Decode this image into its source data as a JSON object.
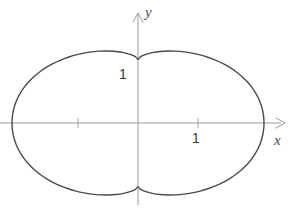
{
  "figure": {
    "kind": "math-plot",
    "background_color": "#ffffff",
    "curve_color": "#4a4a4a",
    "axis_color": "#9a9a9a",
    "label_color": "#3a3a3a"
  },
  "axes": {
    "x_label": "x",
    "y_label": "y",
    "x_arrow": "arrow-right",
    "y_arrow": "arrow-up",
    "origin_px": {
      "x": 138,
      "y": 123
    },
    "unit_px": 60,
    "x_range": [
      -2.3,
      2.55
    ],
    "y_range": [
      -1.45,
      1.95
    ],
    "grid": false
  },
  "ticks": {
    "x": [
      {
        "value": -1,
        "label": "",
        "px": 78
      },
      {
        "value": 1,
        "label": "1",
        "px": 198
      }
    ],
    "y": [
      {
        "value": 1,
        "label": "1",
        "px": 63
      }
    ]
  },
  "chart_data": {
    "type": "line",
    "title": "",
    "xlabel": "x",
    "ylabel": "y",
    "xlim": [
      -2.3,
      2.55
    ],
    "ylim": [
      -1.45,
      1.95
    ],
    "grid": false,
    "legend": null,
    "annotations": [
      {
        "text": "1",
        "axis": "x",
        "x": 1,
        "y": 0
      },
      {
        "text": "1",
        "axis": "y",
        "x": 0,
        "y": 1
      }
    ],
    "series": [
      {
        "name": "cassini-oval",
        "closed": true,
        "description": "Peanut-shaped closed curve (Cassini oval) symmetric about both axes; crosses the y-axis at y = +1 and y = -1, reaches x extremes near x = -2.12 and x = +2.1, and bulges to maximum height near y = +1.31 at x = -0.9 and x = +0.95.",
        "points": [
          [
            2.1,
            0.0
          ],
          [
            2.094,
            0.104
          ],
          [
            2.077,
            0.208
          ],
          [
            2.048,
            0.311
          ],
          [
            2.007,
            0.412
          ],
          [
            1.954,
            0.51
          ],
          [
            1.889,
            0.605
          ],
          [
            1.813,
            0.695
          ],
          [
            1.726,
            0.78
          ],
          [
            1.629,
            0.859
          ],
          [
            1.523,
            0.93
          ],
          [
            1.409,
            0.994
          ],
          [
            1.289,
            1.049
          ],
          [
            1.163,
            1.096
          ],
          [
            1.033,
            1.135
          ],
          [
            0.9,
            1.165
          ],
          [
            0.766,
            1.186
          ],
          [
            0.631,
            1.198
          ],
          [
            0.497,
            1.2
          ],
          [
            0.366,
            1.192
          ],
          [
            0.239,
            1.173
          ],
          [
            0.119,
            1.141
          ],
          [
            0.043,
            1.106
          ],
          [
            0.0,
            1.06
          ],
          [
            -0.043,
            1.106
          ],
          [
            -0.119,
            1.141
          ],
          [
            -0.239,
            1.173
          ],
          [
            -0.366,
            1.192
          ],
          [
            -0.497,
            1.2
          ],
          [
            -0.631,
            1.198
          ],
          [
            -0.766,
            1.186
          ],
          [
            -0.9,
            1.165
          ],
          [
            -1.033,
            1.135
          ],
          [
            -1.163,
            1.096
          ],
          [
            -1.289,
            1.049
          ],
          [
            -1.409,
            0.994
          ],
          [
            -1.523,
            0.93
          ],
          [
            -1.629,
            0.859
          ],
          [
            -1.726,
            0.78
          ],
          [
            -1.813,
            0.695
          ],
          [
            -1.889,
            0.605
          ],
          [
            -1.954,
            0.51
          ],
          [
            -2.007,
            0.412
          ],
          [
            -2.048,
            0.311
          ],
          [
            -2.077,
            0.208
          ],
          [
            -2.094,
            0.104
          ],
          [
            -2.1,
            0.0
          ],
          [
            -2.094,
            -0.104
          ],
          [
            -2.077,
            -0.208
          ],
          [
            -2.048,
            -0.311
          ],
          [
            -2.007,
            -0.412
          ],
          [
            -1.954,
            -0.51
          ],
          [
            -1.889,
            -0.605
          ],
          [
            -1.813,
            -0.695
          ],
          [
            -1.726,
            -0.78
          ],
          [
            -1.629,
            -0.859
          ],
          [
            -1.523,
            -0.93
          ],
          [
            -1.409,
            -0.994
          ],
          [
            -1.289,
            -1.049
          ],
          [
            -1.163,
            -1.096
          ],
          [
            -1.033,
            -1.135
          ],
          [
            -0.9,
            -1.165
          ],
          [
            -0.766,
            -1.186
          ],
          [
            -0.631,
            -1.198
          ],
          [
            -0.497,
            -1.2
          ],
          [
            -0.366,
            -1.192
          ],
          [
            -0.239,
            -1.173
          ],
          [
            -0.119,
            -1.141
          ],
          [
            -0.043,
            -1.106
          ],
          [
            0.0,
            -1.06
          ],
          [
            0.043,
            -1.106
          ],
          [
            0.119,
            -1.141
          ],
          [
            0.239,
            -1.173
          ],
          [
            0.366,
            -1.192
          ],
          [
            0.497,
            -1.2
          ],
          [
            0.631,
            -1.198
          ],
          [
            0.766,
            -1.186
          ],
          [
            0.9,
            -1.165
          ],
          [
            1.033,
            -1.135
          ],
          [
            1.163,
            -1.096
          ],
          [
            1.289,
            -1.049
          ],
          [
            1.409,
            -0.994
          ],
          [
            1.523,
            -0.93
          ],
          [
            1.629,
            -0.859
          ],
          [
            1.726,
            -0.78
          ],
          [
            1.813,
            -0.695
          ],
          [
            1.889,
            -0.605
          ],
          [
            1.954,
            -0.51
          ],
          [
            2.007,
            -0.412
          ],
          [
            2.048,
            -0.311
          ],
          [
            2.077,
            -0.208
          ],
          [
            2.094,
            -0.104
          ]
        ]
      }
    ]
  }
}
